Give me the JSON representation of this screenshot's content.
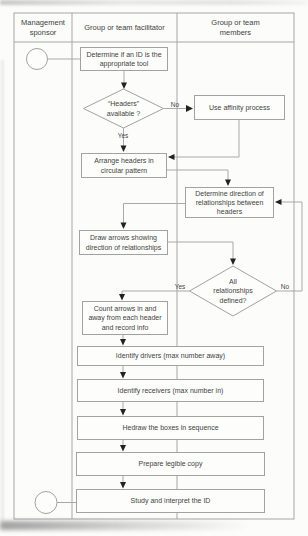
{
  "diagram": {
    "lanes": [
      {
        "id": "sponsor",
        "label": "Management sponsor"
      },
      {
        "id": "facilitator",
        "label": "Group or team facilitator"
      },
      {
        "id": "members",
        "label": "Group or team members"
      }
    ],
    "nodes": {
      "determine_tool": "Determine if an ID is the appropriate tool",
      "headers_available": "“Headers” available ?",
      "use_affinity": "Use affinity process",
      "arrange_headers": "Arrange headers in circular pattern",
      "determine_direction": "Determine direction of relationships between headers",
      "draw_arrows": "Draw arrows showing direction of relationships",
      "all_defined": "All relationships defined?",
      "count_arrows": "Count arrows in and away from each header and record info",
      "identify_drivers": "Identify drivers (max number away)",
      "identify_receivers": "Identify receivers (max number in)",
      "redraw_boxes": "Hedraw the boxes in sequence",
      "prepare_copy": "Prepare legible copy",
      "study_interpret": "Study and interpret the ID"
    },
    "edge_labels": {
      "no1": "No",
      "yes1": "Yes",
      "yes2": "Yes",
      "no2": "No"
    },
    "colors": {
      "frame_line": "#a6a6a6",
      "connector": "#a9a9a9",
      "box_border": "#a2a2a2",
      "box_fill": "#fdfdfc",
      "text": "#3f3f3f",
      "arrowhead": "#222222",
      "background": "#fcfcfb"
    }
  }
}
